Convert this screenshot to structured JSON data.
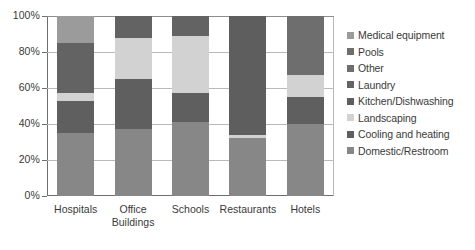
{
  "chart_data": {
    "type": "bar",
    "subtype": "stacked-percent",
    "title": "",
    "xlabel": "",
    "ylabel": "",
    "ylim": [
      0,
      100
    ],
    "yticks": [
      "0%",
      "20%",
      "40%",
      "60%",
      "80%",
      "100%"
    ],
    "ytick_values": [
      0,
      20,
      40,
      60,
      80,
      100
    ],
    "grid": true,
    "legend_position": "right",
    "categories": [
      "Hospitals",
      "Office\nBuildings",
      "Schools",
      "Restaurants",
      "Hotels"
    ],
    "series": [
      {
        "name": "Medical equipment",
        "color": "#9b9b9b",
        "values": [
          15,
          0,
          0,
          0,
          0
        ]
      },
      {
        "name": "Pools",
        "color": "#6e6e6e",
        "values": [
          0,
          0,
          0,
          0,
          33
        ]
      },
      {
        "name": "Other",
        "color": "#6e6e6e",
        "values": [
          0,
          0,
          0,
          0,
          0
        ]
      },
      {
        "name": "Laundry",
        "color": "#636363",
        "values": [
          28,
          12,
          11,
          0,
          0
        ]
      },
      {
        "name": "Kitchen/Dishwashing",
        "color": "#5e5e5e",
        "values": [
          0,
          0,
          0,
          66,
          0
        ]
      },
      {
        "name": "Landscaping",
        "color": "#d2d2d2",
        "values": [
          4,
          23,
          32,
          2,
          12
        ]
      },
      {
        "name": "Cooling and heating",
        "color": "#5f5f5f",
        "values": [
          18,
          28,
          16,
          0,
          15
        ]
      },
      {
        "name": "Domestic/Restroom",
        "color": "#878787",
        "values": [
          35,
          37,
          41,
          32,
          40
        ]
      }
    ],
    "stack_order_bottom_to_top": [
      "Domestic/Restroom",
      "Cooling and heating",
      "Landscaping",
      "Kitchen/Dishwashing",
      "Laundry",
      "Other",
      "Pools",
      "Medical equipment"
    ],
    "legend_entries": [
      {
        "label": "Medical equipment",
        "color": "#9b9b9b"
      },
      {
        "label": "Pools",
        "color": "#6e6e6e"
      },
      {
        "label": "Other",
        "color": "#6e6e6e"
      },
      {
        "label": "Laundry",
        "color": "#636363"
      },
      {
        "label": "Kitchen/Dishwashing",
        "color": "#5e5e5e"
      },
      {
        "label": "Landscaping",
        "color": "#d2d2d2"
      },
      {
        "label": "Cooling and heating",
        "color": "#5f5f5f"
      },
      {
        "label": "Domestic/Restroom",
        "color": "#878787"
      }
    ]
  }
}
